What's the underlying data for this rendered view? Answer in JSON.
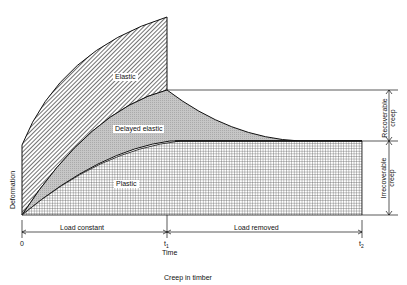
{
  "figure": {
    "caption": "Creep    in    timber",
    "regions": {
      "elastic": "Elastic",
      "delayed_elastic": "Delayed    elastic",
      "plastic": "Plastic"
    },
    "y_axis_label": "Deformation",
    "x_axis_label": "Time",
    "ticks": {
      "origin": "0",
      "t1": "t",
      "t1_sub": "1",
      "t2": "t",
      "t2_sub": "2"
    },
    "spans": {
      "load_constant": "Load    constant",
      "load_removed": "Load    removed"
    },
    "brackets": {
      "recoverable": "Recoverable",
      "recoverable_2": "creep",
      "irrecoverable": "Irrecoverable",
      "irrecoverable_2": "creep"
    },
    "colors": {
      "line": "#111111",
      "delayed_fill": "#c8c8c8",
      "background": "#ffffff"
    }
  }
}
